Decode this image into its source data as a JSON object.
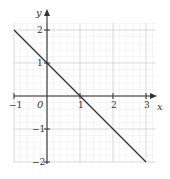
{
  "chart_data": {
    "type": "line",
    "title": "",
    "xlabel": "x",
    "ylabel": "y",
    "xlim": [
      -1,
      3.3
    ],
    "ylim": [
      -2,
      2.2
    ],
    "grid": true,
    "grid_minor_step": 0.2,
    "x_ticks": [
      -1,
      0,
      1,
      2,
      3
    ],
    "y_ticks": [
      -2,
      -1,
      0,
      1,
      2
    ],
    "x_tick_labels": [
      "−1",
      "0",
      "1",
      "2",
      "3"
    ],
    "y_tick_labels": [
      "−2",
      "−1",
      "",
      "1",
      "2"
    ],
    "origin_label": "0",
    "series": [
      {
        "name": "y = 1 − x",
        "x": [
          -1,
          0,
          1,
          2,
          3
        ],
        "y": [
          2,
          1,
          0,
          -1,
          -2
        ],
        "color": "#333333"
      }
    ]
  },
  "labels": {
    "x_axis": "x",
    "y_axis": "y",
    "origin": "0",
    "x_neg1": "−1",
    "x_1": "1",
    "x_2": "2",
    "x_3": "3",
    "y_1": "1",
    "y_2": "2",
    "y_neg1": "−1",
    "y_neg2": "−2"
  }
}
